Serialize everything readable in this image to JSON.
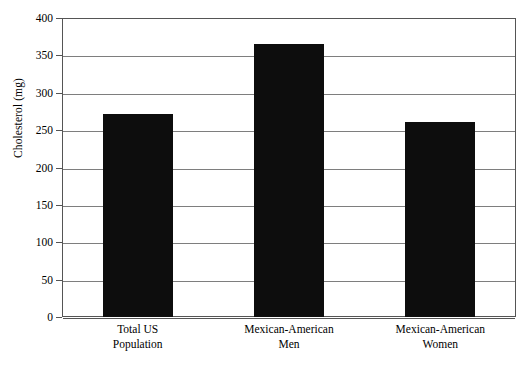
{
  "chart_data": {
    "type": "bar",
    "title": "",
    "xlabel": "",
    "ylabel": "Cholesterol (mg)",
    "categories": [
      "Total US Population",
      "Mexican-American Men",
      "Mexican-American Women"
    ],
    "category_lines": [
      [
        "Total US",
        "Population"
      ],
      [
        "Mexican-American",
        "Men"
      ],
      [
        "Mexican-American",
        "Women"
      ]
    ],
    "values": [
      272,
      365,
      261
    ],
    "ylim": [
      0,
      400
    ],
    "ytick_step": 50,
    "yticks": [
      0,
      50,
      100,
      150,
      200,
      250,
      300,
      350,
      400
    ],
    "ytick_labels": [
      "0",
      "50",
      "100",
      "150",
      "200",
      "250",
      "300",
      "350",
      "400"
    ],
    "grid": true,
    "legend": false,
    "bar_color": "#0d0d0d",
    "grid_color": "#7e7e7e",
    "frame_color": "#555555",
    "background_color": "#ffffff"
  }
}
